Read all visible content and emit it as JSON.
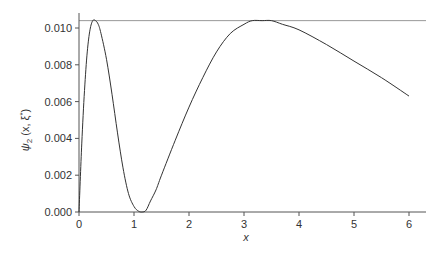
{
  "chart_data": {
    "type": "line",
    "title": "",
    "xlabel": "x",
    "ylabel": "ψ2 (x, ξ*)",
    "ylabel_parts": {
      "main": "ψ",
      "sub": "2",
      "args": " (x, ξ",
      "sup": "*",
      "close": ")"
    },
    "xlim": [
      0,
      6.3
    ],
    "ylim": [
      0,
      0.0108
    ],
    "xticks": [
      0,
      1,
      2,
      3,
      4,
      5,
      6
    ],
    "xtick_labels": [
      "0",
      "1",
      "2",
      "3",
      "4",
      "5",
      "6"
    ],
    "yticks": [
      0.0,
      0.002,
      0.004,
      0.006,
      0.008,
      0.01
    ],
    "ytick_labels": [
      "0.000",
      "0.002",
      "0.004",
      "0.006",
      "0.008",
      "0.010"
    ],
    "grid": false,
    "legend": null,
    "reference_line": {
      "orientation": "horizontal",
      "y": 0.0104,
      "color": "#999999"
    },
    "series": [
      {
        "name": "ψ2(x, ξ*)",
        "color": "#333333",
        "x": [
          0,
          0.05,
          0.1,
          0.15,
          0.2,
          0.25,
          0.3,
          0.35,
          0.4,
          0.5,
          0.6,
          0.7,
          0.8,
          0.9,
          1.0,
          1.08,
          1.15,
          1.22,
          1.3,
          1.4,
          1.5,
          1.75,
          2.0,
          2.25,
          2.5,
          2.75,
          3.0,
          3.15,
          3.33,
          3.5,
          3.7,
          4.0,
          4.5,
          5.0,
          5.5,
          6.0
        ],
        "values": [
          0,
          0.0037,
          0.0066,
          0.0087,
          0.0099,
          0.0104,
          0.0104,
          0.0102,
          0.0097,
          0.0083,
          0.0064,
          0.0043,
          0.0024,
          0.001,
          0.0003,
          5e-05,
          0.0,
          0.0001,
          0.0006,
          0.0012,
          0.002,
          0.0039,
          0.0057,
          0.0073,
          0.0087,
          0.0097,
          0.0102,
          0.0104,
          0.0104,
          0.0104,
          0.0102,
          0.0099,
          0.0091,
          0.0082,
          0.0073,
          0.0063
        ]
      }
    ]
  }
}
